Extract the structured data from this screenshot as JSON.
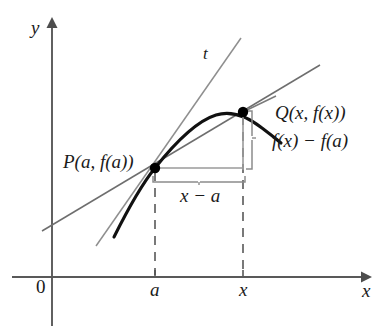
{
  "figure": {
    "kind": "calculus-derivative-diagram",
    "colors": {
      "axis": "#595959",
      "curve": "#111111",
      "tangent_line": "#8c8c8c",
      "secant_line": "#6e6e6e",
      "dashed_guide": "#4d4d4d",
      "bracket": "#8c8c8c",
      "point_fill": "#000000",
      "text": "#1a1a1a",
      "background": "#ffffff"
    },
    "axes": {
      "y_axis_label": "y",
      "x_axis_label": "x",
      "origin_label": "0",
      "x_axis_y_px": 277,
      "y_axis_x_px": 52,
      "x_axis_arrow_tip_px": 370,
      "y_axis_arrow_tip_px": 21
    },
    "ticks": [
      {
        "name": "a",
        "label": "a",
        "x_px": 155
      },
      {
        "name": "x",
        "label": "x",
        "x_px": 243
      }
    ],
    "points": [
      {
        "name": "P",
        "label": "P(a, f(a))",
        "x_px": 155,
        "y_px": 168
      },
      {
        "name": "Q",
        "label": "Q(x, f(x))",
        "x_px": 243,
        "y_px": 112
      }
    ],
    "lines": [
      {
        "name": "tangent-line",
        "label": "t",
        "description": "tangent line to the curve at P",
        "x1_px": 96,
        "y1_px": 246,
        "x2_px": 241,
        "y2_px": 38
      },
      {
        "name": "secant-line",
        "label": "",
        "description": "secant line through P and Q",
        "x1_px": 42,
        "y1_px": 231,
        "x2_px": 320,
        "y2_px": 65
      }
    ],
    "curve": {
      "name": "function-curve",
      "description": "graph of y = f(x), concave down, peak between a and x",
      "path": "M 114,237 C 130,205 142,184 155,168 C 178,139 200,120 216,115 C 232,110 248,117 262,128 C 270,134 275,138 281,143"
    },
    "annotations": [
      {
        "name": "rise-bracket",
        "label": "f(x) − f(a)",
        "orientation": "vertical",
        "from_px": 112,
        "to_px": 168,
        "at_px": 252
      },
      {
        "name": "run-bracket",
        "label": "x − a",
        "orientation": "horizontal",
        "from_px": 155,
        "to_px": 243,
        "at_px": 180
      }
    ],
    "guides": [
      {
        "name": "dashed-vertical-at-a",
        "x_px": 155,
        "y1_px": 170,
        "y2_px": 277
      },
      {
        "name": "dashed-vertical-at-x",
        "x_px": 243,
        "y1_px": 114,
        "y2_px": 277
      },
      {
        "name": "horizontal-run-line",
        "y_px": 168,
        "x1_px": 155,
        "x2_px": 243
      },
      {
        "name": "vertical-rise-line",
        "x_px": 243,
        "y1_px": 112,
        "y2_px": 170
      }
    ]
  }
}
